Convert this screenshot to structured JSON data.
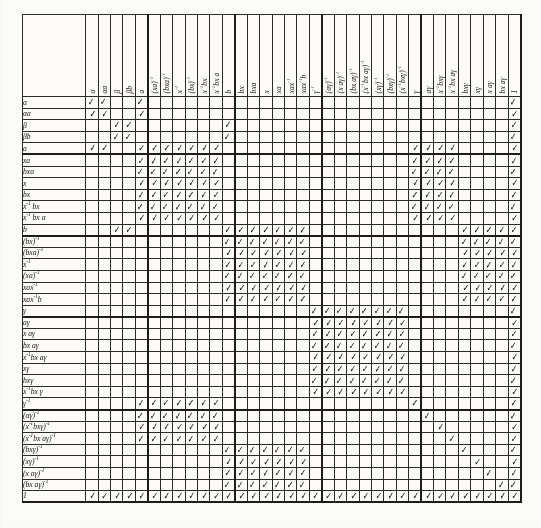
{
  "figure": {
    "type": "incidence-matrix-table",
    "tick_glyph": "check-mark",
    "tick_char": "✓",
    "rows_count": 35,
    "cols_count": 35,
    "ink_color": "#141414",
    "paper_color": "#fcfbf9"
  },
  "columns": [
    "α",
    "αa",
    "β",
    "βb",
    "a",
    "(xa)⁻¹",
    "(bxa)⁻¹",
    "x⁻¹",
    "(bx)⁻¹",
    "x⁻¹bx",
    "x⁻¹bx a",
    "b",
    "bx",
    "bxa",
    "x",
    "xa",
    "xax⁻¹",
    "xax⁻¹b",
    "γ⁻¹",
    "(αγ)⁻¹",
    "(x aγ)⁻¹",
    "(bx aγ)⁻¹",
    "(x⁻¹bx aγ)⁻¹",
    "(xγ)⁻¹",
    "(bxγ)⁻¹",
    "(x⁻¹bxγ)⁻¹",
    "γ",
    "aγ",
    "x⁻¹bxγ",
    "x⁻¹bx aγ",
    "bxγ",
    "xγ",
    "x aγ",
    "bx aγ",
    "1"
  ],
  "rows": [
    "α",
    "αa",
    "β",
    "βb",
    "a",
    "xa",
    "bxa",
    "x",
    "bx",
    "x⁻¹ bx",
    "x⁻¹ bx a",
    "b",
    "(bx)⁻¹",
    "(bxa)⁻¹",
    "x⁻¹",
    "(xa)⁻¹",
    "xax⁻¹",
    "xax⁻¹b",
    "γ",
    "aγ",
    "x aγ",
    "bx aγ",
    "x⁻¹bx aγ",
    "xγ",
    "bxγ",
    "x⁻¹bx γ",
    "γ⁻¹",
    "(αγ)⁻¹",
    "(x⁻¹bxγ)⁻¹",
    "(x⁻¹bx aγ)⁻¹",
    "(bxγ)⁻¹",
    "(xγ)⁻¹",
    "(x aγ)⁻¹",
    "(bx aγ)⁻¹",
    "1"
  ],
  "matrix": [
    [
      1,
      1,
      0,
      0,
      1,
      0,
      0,
      0,
      0,
      0,
      0,
      0,
      0,
      0,
      0,
      0,
      0,
      0,
      0,
      0,
      0,
      0,
      0,
      0,
      0,
      0,
      0,
      0,
      0,
      0,
      0,
      0,
      0,
      0,
      1
    ],
    [
      1,
      1,
      0,
      0,
      1,
      0,
      0,
      0,
      0,
      0,
      0,
      0,
      0,
      0,
      0,
      0,
      0,
      0,
      0,
      0,
      0,
      0,
      0,
      0,
      0,
      0,
      0,
      0,
      0,
      0,
      0,
      0,
      0,
      0,
      1
    ],
    [
      0,
      0,
      1,
      1,
      0,
      0,
      0,
      0,
      0,
      0,
      0,
      1,
      0,
      0,
      0,
      0,
      0,
      0,
      0,
      0,
      0,
      0,
      0,
      0,
      0,
      0,
      0,
      0,
      0,
      0,
      0,
      0,
      0,
      0,
      1
    ],
    [
      0,
      0,
      1,
      1,
      0,
      0,
      0,
      0,
      0,
      0,
      0,
      1,
      0,
      0,
      0,
      0,
      0,
      0,
      0,
      0,
      0,
      0,
      0,
      0,
      0,
      0,
      0,
      0,
      0,
      0,
      0,
      0,
      0,
      0,
      1
    ],
    [
      1,
      1,
      0,
      0,
      1,
      1,
      1,
      1,
      1,
      1,
      1,
      0,
      0,
      0,
      0,
      0,
      0,
      0,
      0,
      0,
      0,
      0,
      0,
      0,
      0,
      0,
      1,
      1,
      1,
      1,
      0,
      0,
      0,
      0,
      1
    ],
    [
      0,
      0,
      0,
      0,
      1,
      1,
      1,
      1,
      1,
      1,
      1,
      0,
      0,
      0,
      0,
      0,
      0,
      0,
      0,
      0,
      0,
      0,
      0,
      0,
      0,
      0,
      1,
      1,
      1,
      1,
      0,
      0,
      0,
      0,
      1
    ],
    [
      0,
      0,
      0,
      0,
      1,
      1,
      1,
      1,
      1,
      1,
      1,
      0,
      0,
      0,
      0,
      0,
      0,
      0,
      0,
      0,
      0,
      0,
      0,
      0,
      0,
      0,
      1,
      1,
      1,
      1,
      0,
      0,
      0,
      0,
      1
    ],
    [
      0,
      0,
      0,
      0,
      1,
      1,
      1,
      1,
      1,
      1,
      1,
      0,
      0,
      0,
      0,
      0,
      0,
      0,
      0,
      0,
      0,
      0,
      0,
      0,
      0,
      0,
      1,
      1,
      1,
      1,
      0,
      0,
      0,
      0,
      1
    ],
    [
      0,
      0,
      0,
      0,
      1,
      1,
      1,
      1,
      1,
      1,
      1,
      0,
      0,
      0,
      0,
      0,
      0,
      0,
      0,
      0,
      0,
      0,
      0,
      0,
      0,
      0,
      1,
      1,
      1,
      1,
      0,
      0,
      0,
      0,
      1
    ],
    [
      0,
      0,
      0,
      0,
      1,
      1,
      1,
      1,
      1,
      1,
      1,
      0,
      0,
      0,
      0,
      0,
      0,
      0,
      0,
      0,
      0,
      0,
      0,
      0,
      0,
      0,
      1,
      1,
      1,
      1,
      0,
      0,
      0,
      0,
      1
    ],
    [
      0,
      0,
      0,
      0,
      1,
      1,
      1,
      1,
      1,
      1,
      1,
      0,
      0,
      0,
      0,
      0,
      0,
      0,
      0,
      0,
      0,
      0,
      0,
      0,
      0,
      0,
      1,
      1,
      1,
      1,
      0,
      0,
      0,
      0,
      1
    ],
    [
      0,
      0,
      1,
      1,
      0,
      0,
      0,
      0,
      0,
      0,
      0,
      1,
      1,
      1,
      1,
      1,
      1,
      1,
      0,
      0,
      0,
      0,
      0,
      0,
      0,
      0,
      0,
      0,
      0,
      0,
      1,
      1,
      1,
      1,
      1
    ],
    [
      0,
      0,
      0,
      0,
      0,
      0,
      0,
      0,
      0,
      0,
      0,
      1,
      1,
      1,
      1,
      1,
      1,
      1,
      0,
      0,
      0,
      0,
      0,
      0,
      0,
      0,
      0,
      0,
      0,
      0,
      1,
      1,
      1,
      1,
      1
    ],
    [
      0,
      0,
      0,
      0,
      0,
      0,
      0,
      0,
      0,
      0,
      0,
      1,
      1,
      1,
      1,
      1,
      1,
      1,
      0,
      0,
      0,
      0,
      0,
      0,
      0,
      0,
      0,
      0,
      0,
      0,
      1,
      1,
      1,
      1,
      1
    ],
    [
      0,
      0,
      0,
      0,
      0,
      0,
      0,
      0,
      0,
      0,
      0,
      1,
      1,
      1,
      1,
      1,
      1,
      1,
      0,
      0,
      0,
      0,
      0,
      0,
      0,
      0,
      0,
      0,
      0,
      0,
      1,
      1,
      1,
      1,
      1
    ],
    [
      0,
      0,
      0,
      0,
      0,
      0,
      0,
      0,
      0,
      0,
      0,
      1,
      1,
      1,
      1,
      1,
      1,
      1,
      0,
      0,
      0,
      0,
      0,
      0,
      0,
      0,
      0,
      0,
      0,
      0,
      1,
      1,
      1,
      1,
      1
    ],
    [
      0,
      0,
      0,
      0,
      0,
      0,
      0,
      0,
      0,
      0,
      0,
      1,
      1,
      1,
      1,
      1,
      1,
      1,
      0,
      0,
      0,
      0,
      0,
      0,
      0,
      0,
      0,
      0,
      0,
      0,
      1,
      1,
      1,
      1,
      1
    ],
    [
      0,
      0,
      0,
      0,
      0,
      0,
      0,
      0,
      0,
      0,
      0,
      1,
      1,
      1,
      1,
      1,
      1,
      1,
      0,
      0,
      0,
      0,
      0,
      0,
      0,
      0,
      0,
      0,
      0,
      0,
      1,
      1,
      1,
      1,
      1
    ],
    [
      0,
      0,
      0,
      0,
      0,
      0,
      0,
      0,
      0,
      0,
      0,
      0,
      0,
      0,
      0,
      0,
      0,
      0,
      1,
      1,
      1,
      1,
      1,
      1,
      1,
      1,
      0,
      0,
      0,
      0,
      0,
      0,
      0,
      0,
      1
    ],
    [
      0,
      0,
      0,
      0,
      0,
      0,
      0,
      0,
      0,
      0,
      0,
      0,
      0,
      0,
      0,
      0,
      0,
      0,
      1,
      1,
      1,
      1,
      1,
      1,
      1,
      1,
      0,
      0,
      0,
      0,
      0,
      0,
      0,
      0,
      1
    ],
    [
      0,
      0,
      0,
      0,
      0,
      0,
      0,
      0,
      0,
      0,
      0,
      0,
      0,
      0,
      0,
      0,
      0,
      0,
      1,
      1,
      1,
      1,
      1,
      1,
      1,
      1,
      0,
      0,
      0,
      0,
      0,
      0,
      0,
      0,
      1
    ],
    [
      0,
      0,
      0,
      0,
      0,
      0,
      0,
      0,
      0,
      0,
      0,
      0,
      0,
      0,
      0,
      0,
      0,
      0,
      1,
      1,
      1,
      1,
      1,
      1,
      1,
      1,
      0,
      0,
      0,
      0,
      0,
      0,
      0,
      0,
      1
    ],
    [
      0,
      0,
      0,
      0,
      0,
      0,
      0,
      0,
      0,
      0,
      0,
      0,
      0,
      0,
      0,
      0,
      0,
      0,
      1,
      1,
      1,
      1,
      1,
      1,
      1,
      1,
      0,
      0,
      0,
      0,
      0,
      0,
      0,
      0,
      1
    ],
    [
      0,
      0,
      0,
      0,
      0,
      0,
      0,
      0,
      0,
      0,
      0,
      0,
      0,
      0,
      0,
      0,
      0,
      0,
      1,
      1,
      1,
      1,
      1,
      1,
      1,
      1,
      0,
      0,
      0,
      0,
      0,
      0,
      0,
      0,
      1
    ],
    [
      0,
      0,
      0,
      0,
      0,
      0,
      0,
      0,
      0,
      0,
      0,
      0,
      0,
      0,
      0,
      0,
      0,
      0,
      1,
      1,
      1,
      1,
      1,
      1,
      1,
      1,
      0,
      0,
      0,
      0,
      0,
      0,
      0,
      0,
      1
    ],
    [
      0,
      0,
      0,
      0,
      0,
      0,
      0,
      0,
      0,
      0,
      0,
      0,
      0,
      0,
      0,
      0,
      0,
      0,
      1,
      1,
      1,
      1,
      1,
      1,
      1,
      1,
      0,
      0,
      0,
      0,
      0,
      0,
      0,
      0,
      1
    ],
    [
      0,
      0,
      0,
      0,
      1,
      1,
      1,
      1,
      1,
      1,
      1,
      0,
      0,
      0,
      0,
      0,
      0,
      0,
      0,
      0,
      0,
      0,
      0,
      0,
      0,
      0,
      1,
      0,
      0,
      0,
      0,
      0,
      0,
      0,
      1
    ],
    [
      0,
      0,
      0,
      0,
      1,
      1,
      1,
      1,
      1,
      1,
      1,
      0,
      0,
      0,
      0,
      0,
      0,
      0,
      0,
      0,
      0,
      0,
      0,
      0,
      0,
      0,
      0,
      1,
      0,
      0,
      0,
      0,
      0,
      0,
      1
    ],
    [
      0,
      0,
      0,
      0,
      1,
      1,
      1,
      1,
      1,
      1,
      1,
      0,
      0,
      0,
      0,
      0,
      0,
      0,
      0,
      0,
      0,
      0,
      0,
      0,
      0,
      0,
      0,
      0,
      1,
      0,
      0,
      0,
      0,
      0,
      1
    ],
    [
      0,
      0,
      0,
      0,
      1,
      1,
      1,
      1,
      1,
      1,
      1,
      0,
      0,
      0,
      0,
      0,
      0,
      0,
      0,
      0,
      0,
      0,
      0,
      0,
      0,
      0,
      0,
      0,
      0,
      1,
      0,
      0,
      0,
      0,
      1
    ],
    [
      0,
      0,
      0,
      0,
      0,
      0,
      0,
      0,
      0,
      0,
      0,
      1,
      1,
      1,
      1,
      1,
      1,
      1,
      0,
      0,
      0,
      0,
      0,
      0,
      0,
      0,
      0,
      0,
      0,
      0,
      1,
      0,
      0,
      0,
      1
    ],
    [
      0,
      0,
      0,
      0,
      0,
      0,
      0,
      0,
      0,
      0,
      0,
      1,
      1,
      1,
      1,
      1,
      1,
      1,
      0,
      0,
      0,
      0,
      0,
      0,
      0,
      0,
      0,
      0,
      0,
      0,
      0,
      1,
      0,
      0,
      1
    ],
    [
      0,
      0,
      0,
      0,
      0,
      0,
      0,
      0,
      0,
      0,
      0,
      1,
      1,
      1,
      1,
      1,
      1,
      1,
      0,
      0,
      0,
      0,
      0,
      0,
      0,
      0,
      0,
      0,
      0,
      0,
      0,
      0,
      1,
      0,
      1
    ],
    [
      0,
      0,
      0,
      0,
      0,
      0,
      0,
      0,
      0,
      0,
      0,
      1,
      1,
      1,
      1,
      1,
      1,
      1,
      0,
      0,
      0,
      0,
      0,
      0,
      0,
      0,
      0,
      0,
      0,
      0,
      0,
      0,
      0,
      1,
      1
    ],
    [
      1,
      1,
      1,
      1,
      1,
      1,
      1,
      1,
      1,
      1,
      1,
      1,
      1,
      1,
      1,
      1,
      1,
      1,
      1,
      1,
      1,
      1,
      1,
      1,
      1,
      1,
      1,
      1,
      1,
      1,
      1,
      1,
      1,
      1,
      1
    ]
  ],
  "group_breaks": {
    "row_after": [
      4,
      11,
      18,
      26,
      34
    ],
    "col_after": [
      4,
      11,
      18,
      26,
      34
    ]
  }
}
